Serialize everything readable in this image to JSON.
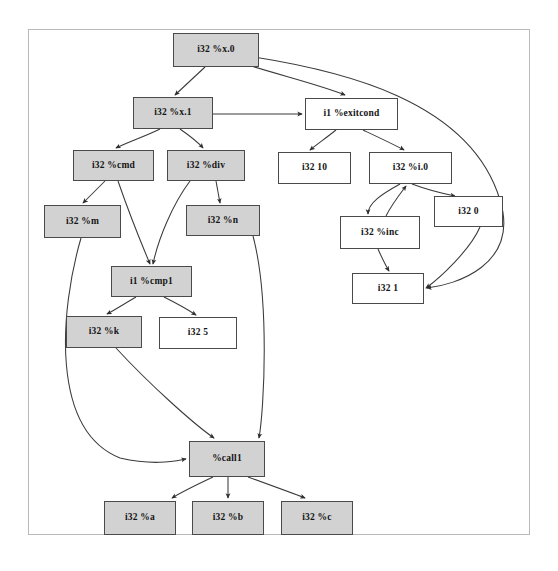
{
  "diagram": {
    "frame": {
      "border_color": "#b9b9b9"
    },
    "style": {
      "filled_fill": "#d2d2d2",
      "plain_fill": "#ffffff",
      "node_border": "#4a4a4a",
      "edge_color": "#3a3a3a"
    },
    "nodes": [
      {
        "id": "x0",
        "label": "i32 %x.0",
        "fill": "filled",
        "x": 173,
        "y": 33,
        "w": 86,
        "h": 34
      },
      {
        "id": "x1",
        "label": "i32 %x.1",
        "fill": "filled",
        "x": 133,
        "y": 97,
        "w": 80,
        "h": 32
      },
      {
        "id": "exitcond",
        "label": "i1 %exitcond",
        "fill": "plain",
        "x": 305,
        "y": 98,
        "w": 93,
        "h": 32
      },
      {
        "id": "cmd",
        "label": "i32 %cmd",
        "fill": "filled",
        "x": 73,
        "y": 150,
        "w": 81,
        "h": 31
      },
      {
        "id": "div",
        "label": "i32 %div",
        "fill": "filled",
        "x": 167,
        "y": 150,
        "w": 78,
        "h": 31
      },
      {
        "id": "ten",
        "label": "i32 10",
        "fill": "plain",
        "x": 278,
        "y": 152,
        "w": 73,
        "h": 32
      },
      {
        "id": "i0",
        "label": "i32 %i.0",
        "fill": "plain",
        "x": 369,
        "y": 152,
        "w": 83,
        "h": 32
      },
      {
        "id": "m",
        "label": "i32 %m",
        "fill": "filled",
        "x": 44,
        "y": 205,
        "w": 77,
        "h": 33
      },
      {
        "id": "n",
        "label": "i32 %n",
        "fill": "filled",
        "x": 186,
        "y": 205,
        "w": 74,
        "h": 31
      },
      {
        "id": "zero",
        "label": "i32 0",
        "fill": "plain",
        "x": 434,
        "y": 196,
        "w": 69,
        "h": 31
      },
      {
        "id": "inc",
        "label": "i32 %inc",
        "fill": "plain",
        "x": 340,
        "y": 216,
        "w": 80,
        "h": 33
      },
      {
        "id": "cmp1",
        "label": "i1 %cmp1",
        "fill": "filled",
        "x": 111,
        "y": 266,
        "w": 81,
        "h": 31
      },
      {
        "id": "one",
        "label": "i32 1",
        "fill": "plain",
        "x": 352,
        "y": 273,
        "w": 72,
        "h": 31
      },
      {
        "id": "k",
        "label": "i32 %k",
        "fill": "filled",
        "x": 66,
        "y": 316,
        "w": 76,
        "h": 32
      },
      {
        "id": "five",
        "label": "i32 5",
        "fill": "plain",
        "x": 159,
        "y": 317,
        "w": 78,
        "h": 32
      },
      {
        "id": "call1",
        "label": "%call1",
        "fill": "filled",
        "x": 189,
        "y": 441,
        "w": 76,
        "h": 36
      },
      {
        "id": "a",
        "label": "i32 %a",
        "fill": "filled",
        "x": 104,
        "y": 501,
        "w": 72,
        "h": 34
      },
      {
        "id": "b",
        "label": "i32 %b",
        "fill": "filled",
        "x": 192,
        "y": 501,
        "w": 72,
        "h": 34
      },
      {
        "id": "c",
        "label": "i32 %c",
        "fill": "filled",
        "x": 281,
        "y": 501,
        "w": 72,
        "h": 34
      }
    ],
    "edges": [
      {
        "from": "x0",
        "to": "x1",
        "path": "M 205 67 L 175 95"
      },
      {
        "from": "x0",
        "to": "exitcond",
        "path": "M 241 63 C 290 78 320 85 345 95"
      },
      {
        "from": "x0",
        "to": "one",
        "path": "M 247 56 C 340 70 470 100 500 200 C 520 265 455 285 427 288"
      },
      {
        "from": "x1",
        "to": "exitcond",
        "path": "M 213 114 L 302 114"
      },
      {
        "from": "x1",
        "to": "cmd",
        "path": "M 160 129 C 146 136 128 142 116 148"
      },
      {
        "from": "x1",
        "to": "div",
        "path": "M 180 129 C 190 136 198 142 203 148"
      },
      {
        "from": "exitcond",
        "to": "ten",
        "path": "M 336 130 C 326 138 316 145 310 150"
      },
      {
        "from": "exitcond",
        "to": "i0",
        "path": "M 363 130 C 380 138 395 145 404 150"
      },
      {
        "from": "cmd",
        "to": "m",
        "path": "M 105 181 C 96 190 88 198 83 203"
      },
      {
        "from": "cmd",
        "to": "cmp1",
        "path": "M 118 181 C 128 210 142 245 150 264"
      },
      {
        "from": "div",
        "to": "n",
        "path": "M 216 181 L 220 203"
      },
      {
        "from": "div",
        "to": "cmp1",
        "path": "M 190 181 C 172 205 158 240 153 264"
      },
      {
        "from": "i0",
        "to": "inc",
        "path": "M 400 184 C 382 194 368 203 368 214"
      },
      {
        "from": "inc",
        "to": "i0",
        "path": "M 386 216 C 392 204 400 194 406 186"
      },
      {
        "from": "i0",
        "to": "zero",
        "path": "M 412 184 C 428 190 445 194 455 196"
      },
      {
        "from": "inc",
        "to": "one",
        "path": "M 378 249 C 382 258 386 266 389 271"
      },
      {
        "from": "zero",
        "to": "one",
        "path": "M 480 227 C 470 250 440 278 426 288"
      },
      {
        "from": "cmp1",
        "to": "k",
        "path": "M 136 297 C 124 304 113 311 107 314"
      },
      {
        "from": "cmp1",
        "to": "five",
        "path": "M 164 297 C 178 304 190 311 196 315"
      },
      {
        "from": "n",
        "to": "call1",
        "path": "M 253 236 C 270 300 264 410 259 438"
      },
      {
        "from": "k",
        "to": "call1",
        "path": "M 116 348 C 150 385 195 425 214 438"
      },
      {
        "from": "m",
        "to": "call1",
        "path": "M 81 238 C 60 310 50 430 120 458 C 155 466 175 461 186 459"
      },
      {
        "from": "call1",
        "to": "a",
        "path": "M 213 477 C 196 485 180 493 172 498"
      },
      {
        "from": "call1",
        "to": "b",
        "path": "M 228 477 L 228 498"
      },
      {
        "from": "call1",
        "to": "c",
        "path": "M 248 477 C 270 485 292 493 305 498"
      }
    ]
  }
}
